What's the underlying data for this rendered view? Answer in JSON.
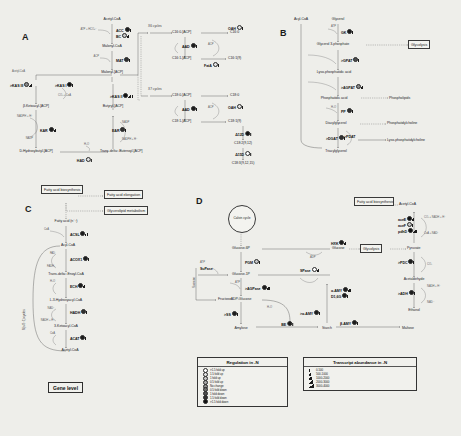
{
  "figure": {
    "panels": [
      "A",
      "B",
      "C",
      "D"
    ]
  },
  "panelA": {
    "letter": "A",
    "nodes": [
      "Acetyl-CoA",
      "Malonyl-CoA",
      "Malonyl-[ACP]",
      "Acetyl-CoA",
      "β-Ketoacyl-[ACP]",
      "D-Hydroxybutyl-[ACP]",
      "Butyryl-[ACP]",
      "Trans-delta²-Butenoyl-[ACP]",
      "C16:0-[ACP]",
      "C16:1-[ACP]",
      "C18:0-[ACP]",
      "C18:1-[ACP]",
      "C16:0",
      "C16:1(9)",
      "C18:0",
      "C18:1(9)",
      "C18:2(9,12)",
      "C18:3(9,12,15)"
    ],
    "enzymes": [
      "ACC",
      "BC",
      "MAT",
      "KAS III",
      "KAS I",
      "KAR",
      "HAD",
      "EAR",
      "KAS II",
      "AAD",
      "OAH",
      "FatA",
      "Δ12D",
      "Δ15D"
    ],
    "cycles": [
      "X6 cycles",
      "X7 cycles"
    ],
    "cofactors": [
      "ATP + HCO₃⁻",
      "ACP",
      "Acetyl-CoA",
      "CO₂ + CoA",
      "NADPH + H⁺",
      "NADP",
      "H₂O",
      "NADP",
      "NADPH + H⁺",
      "ACP",
      "ACP"
    ]
  },
  "panelB": {
    "letter": "B",
    "nodes": [
      "Acyl-CoA",
      "Glycerol",
      "Glycerol 3-phosphate",
      "Lyso-phosphatidic acid",
      "Phosphatidic acid",
      "Diacylglycerol",
      "Triacylglycerol",
      "Glycolysis",
      "Phospholipids",
      "Phosphatidylcholine",
      "Lyso-phosphatidylcholine"
    ],
    "enzymes": [
      "GK",
      "GPAT",
      "AGPAT",
      "PP",
      "DGAT",
      "PDAT"
    ],
    "cofactors": [
      "ATP",
      "H₂O"
    ]
  },
  "panelC": {
    "letter": "C",
    "boxes": [
      "Fatty acid biosynthesis",
      "Fatty acid elongation",
      "Glycerolipid metabolism"
    ],
    "nodes": [
      "Fatty acid (n⁻²)",
      "Acyl-CoA",
      "Trans-delta²-Enoyl-CoA",
      "L-3-Hydroxyacyl-CoA",
      "3-Ketoacyl-CoA",
      "Acetyl-CoA"
    ],
    "enzymes": [
      "ACSL",
      "ACOX1",
      "ECH",
      "HADH",
      "ACAT"
    ],
    "cofactors": [
      "CoA",
      "FAD",
      "FADH₂",
      "H₂O",
      "NAD⁺",
      "NADH + H⁺",
      "CoA"
    ],
    "side_label": "X(n/2−1) cycles",
    "gene_level": "Gene level"
  },
  "panelD": {
    "letter": "D",
    "calvin": "Calvin cycle",
    "boxes": [
      "Fatty acid biosynthesis",
      "Glycolysis"
    ],
    "nodes": [
      "Glucose-6P",
      "Glucose-1P",
      "Sucrose",
      "Fructose",
      "ADP-Glucose",
      "Amylose",
      "Starch",
      "Maltose",
      "Glucose",
      "Pyruvate",
      "Acetaldehyde",
      "Ethanol",
      "Acetyl-CoA"
    ],
    "enzymes": [
      "HXK",
      "PGM",
      "SuPase",
      "SPase",
      "AGPase",
      "SS",
      "BE",
      "β-AMY",
      "α-AMY",
      "α-AMY",
      "D1,6G",
      "PDC",
      "ADH",
      "aceE",
      "aceF",
      "pdhD"
    ],
    "cofactors": [
      "ADP",
      "ATP",
      "ATP",
      "ATP",
      "H₂O",
      "CO₂",
      "NADH + H⁺",
      "NAD⁺",
      "CO₂ + NADH + H⁺",
      "CoA + NAD⁺"
    ]
  },
  "legendRegulation": {
    "title": "Regulation in -N",
    "rows": [
      {
        "label": ">1.5 fold up",
        "color": "#ffffff"
      },
      {
        "label": "1.5 fold up",
        "color": "#e3e3e3"
      },
      {
        "label": "1 fold up",
        "color": "#c6c6c6"
      },
      {
        "label": "0.5 fold up",
        "color": "#a8a8a8"
      },
      {
        "label": "No change",
        "color": "#8a8a8a"
      },
      {
        "label": "0.5 fold down",
        "color": "#6c6c6c"
      },
      {
        "label": "1 fold down",
        "color": "#4e4e4e"
      },
      {
        "label": "1.5 fold down",
        "color": "#303030"
      },
      {
        "label": ">1.5 fold down",
        "color": "#121212"
      }
    ]
  },
  "legendAbundance": {
    "title": "Transcript abundance in -N",
    "rows": [
      {
        "label": "0-500",
        "bars": 1
      },
      {
        "label": "500-1000",
        "bars": 2
      },
      {
        "label": "1000-2000",
        "bars": 3
      },
      {
        "label": "2000-3000",
        "bars": 4
      },
      {
        "label": "3000-4000",
        "bars": 5
      }
    ]
  }
}
